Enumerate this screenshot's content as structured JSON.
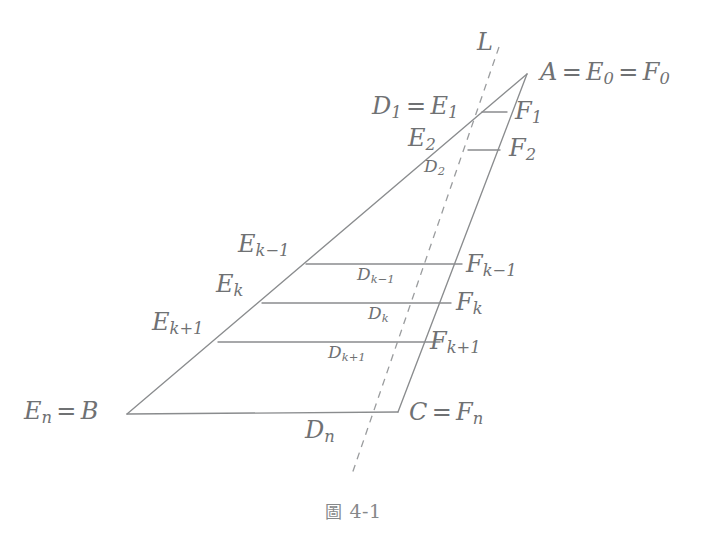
{
  "figure": {
    "caption_cjk": "圖",
    "caption_number": "4-1",
    "stroke_color": "#8a8c8e",
    "label_color": "#6f7173",
    "background": "#ffffff"
  },
  "labels": {
    "line_L": "L",
    "apex": {
      "a": "A",
      "e0": "E",
      "e0_sub": "0",
      "f0": "F",
      "f0_sub": "0",
      "eq": "="
    },
    "d1_e1": {
      "d": "D",
      "d_sub": "1",
      "e": "E",
      "e_sub": "1",
      "eq": "="
    },
    "e2": {
      "base": "E",
      "sub": "2"
    },
    "d2": {
      "base": "D",
      "sub": "2"
    },
    "f1": {
      "base": "F",
      "sub": "1"
    },
    "f2": {
      "base": "F",
      "sub": "2"
    },
    "e_km1": {
      "base": "E",
      "sub": "k−1"
    },
    "e_k": {
      "base": "E",
      "sub": "k"
    },
    "e_kp1": {
      "base": "E",
      "sub": "k+1"
    },
    "d_km1": {
      "base": "D",
      "sub": "k−1"
    },
    "d_k": {
      "base": "D",
      "sub": "k"
    },
    "d_kp1": {
      "base": "D",
      "sub": "k+1"
    },
    "f_km1": {
      "base": "F",
      "sub": "k−1"
    },
    "f_k": {
      "base": "F",
      "sub": "k"
    },
    "f_kp1": {
      "base": "F",
      "sub": "k+1"
    },
    "en_b": {
      "e": "E",
      "e_sub": "n",
      "b": "B",
      "eq": "="
    },
    "c_fn": {
      "c": "C",
      "f": "F",
      "f_sub": "n",
      "eq": "="
    },
    "dn": {
      "base": "D",
      "sub": "n"
    }
  },
  "geometry": {
    "points": {
      "A": [
        527,
        74
      ],
      "B": [
        127,
        414
      ],
      "C": [
        398,
        412
      ],
      "E1": [
        482,
        112
      ],
      "F1": [
        507,
        112
      ],
      "E2": [
        468,
        150
      ],
      "F2": [
        500,
        150
      ],
      "Ekm1": [
        306,
        264
      ],
      "Fkm1": [
        462,
        264
      ],
      "Ek": [
        262,
        303
      ],
      "Fk": [
        451,
        303
      ],
      "Ekp1": [
        218,
        342
      ],
      "Fkp1": [
        440,
        342
      ],
      "L_top": [
        499,
        47
      ],
      "L_bottom": [
        351,
        477
      ]
    },
    "segments": [
      {
        "name": "side-AB",
        "from": "A",
        "to": "B"
      },
      {
        "name": "side-AC",
        "from": "A",
        "to": "C"
      },
      {
        "name": "base-BC",
        "from": "B",
        "to": "C"
      },
      {
        "name": "rung-1",
        "from": "E1",
        "to": "F1"
      },
      {
        "name": "rung-2",
        "from": "E2",
        "to": "F2"
      },
      {
        "name": "rung-km1",
        "from": "Ekm1",
        "to": "Fkm1"
      },
      {
        "name": "rung-k",
        "from": "Ek",
        "to": "Fk"
      },
      {
        "name": "rung-kp1",
        "from": "Ekp1",
        "to": "Fkp1"
      }
    ],
    "dashed_line": {
      "name": "line-L",
      "from": "L_top",
      "to": "L_bottom",
      "dash": "7 6"
    }
  }
}
